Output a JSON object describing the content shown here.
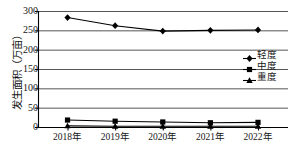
{
  "chart_data": {
    "type": "line",
    "title": "",
    "xlabel": "",
    "ylabel": "发生面积（万亩）",
    "categories": [
      "2018年",
      "2019年",
      "2020年",
      "2021年",
      "2022年"
    ],
    "ylim": [
      0,
      300
    ],
    "yticks": [
      0,
      50,
      100,
      150,
      200,
      250,
      300
    ],
    "ytick_labels": [
      "0",
      "50",
      "100",
      "150",
      "200",
      "250",
      "300"
    ],
    "grid": "horizontal",
    "legend_position": "center-right",
    "series": [
      {
        "name": "轻度",
        "marker": "diamond",
        "color": "#000000",
        "values": [
          283,
          262,
          248,
          250,
          251
        ]
      },
      {
        "name": "中度",
        "marker": "square",
        "color": "#000000",
        "values": [
          18,
          15,
          13,
          11,
          12
        ]
      },
      {
        "name": "重度",
        "marker": "triangle",
        "color": "#000000",
        "values": [
          3,
          2,
          2,
          2,
          2
        ]
      }
    ]
  },
  "axis": {
    "y_title": "发生面积（万亩）"
  },
  "legend": {
    "items": [
      {
        "label": "轻度"
      },
      {
        "label": "中度"
      },
      {
        "label": "重度"
      }
    ]
  },
  "caption": {
    "text": ""
  },
  "colors": {
    "ink": "#000000",
    "grid": "#555555",
    "background": "#ffffff"
  }
}
